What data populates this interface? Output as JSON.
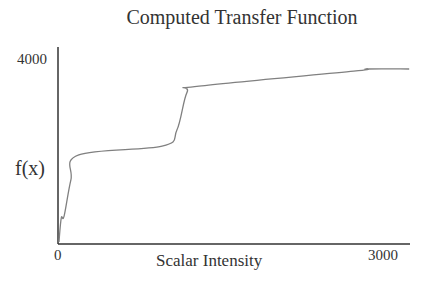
{
  "chart_data": {
    "type": "line",
    "title": "Computed Transfer Function",
    "xlabel": "Scalar Intensity",
    "ylabel": "f(x)",
    "xlim": [
      0,
      3000
    ],
    "ylim": [
      0,
      4000
    ],
    "x_ticks": [
      "0",
      "3000"
    ],
    "y_ticks": [
      "4000"
    ],
    "grid": false,
    "legend": null,
    "series": [
      {
        "name": "f(x)",
        "color": "#808080",
        "x": [
          0,
          20,
          45,
          105,
          175,
          910,
          1040,
          1130,
          1235,
          2600,
          2720,
          3090
        ],
        "y": [
          45,
          570,
          610,
          1400,
          1950,
          2140,
          2490,
          3320,
          3450,
          3780,
          3825,
          3825
        ]
      }
    ]
  },
  "labels": {
    "title": "Computed Transfer Function",
    "ylabel": "f(x)",
    "xlabel": "Scalar Intensity",
    "ytick_top": "4000",
    "xtick_min": "0",
    "xtick_max": "3000"
  },
  "colors": {
    "axis": "#333333",
    "curve": "#808080",
    "text": "#333333"
  }
}
